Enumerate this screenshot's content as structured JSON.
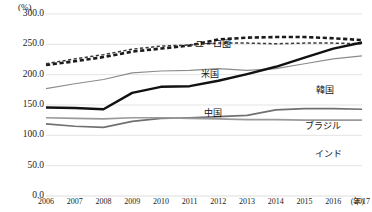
{
  "chart_data": {
    "type": "line",
    "title": "",
    "xlabel": "(年)",
    "ylabel": "(%)",
    "unit_label": "(%)",
    "x_unit_label": "(年)",
    "categories": [
      "2006",
      "2007",
      "2008",
      "2009",
      "2010",
      "2011",
      "2012",
      "2013",
      "2014",
      "2015",
      "2016",
      "2017"
    ],
    "ylim": [
      0,
      300
    ],
    "yticks": [
      "0.0",
      "50.0",
      "100.0",
      "150.0",
      "200.0",
      "250.0",
      "300.0"
    ],
    "ytick_values": [
      0,
      50,
      100,
      150,
      200,
      250,
      300
    ],
    "grid": true,
    "legend": "inline-labels",
    "series": [
      {
        "name": "ユーロ圏",
        "label": "ユーロ圏",
        "color": "#1a1a1a",
        "style": "dashed-thick",
        "values": [
          216.0,
          222.0,
          229.0,
          238.0,
          243.0,
          248.0,
          258.0,
          261.0,
          262.0,
          262.0,
          260.0,
          257.0
        ]
      },
      {
        "name": "米国",
        "label": "米国",
        "color": "#3a3a3a",
        "style": "dashed-thin",
        "values": [
          218.0,
          226.0,
          233.0,
          242.0,
          247.0,
          249.0,
          252.0,
          252.0,
          251.0,
          252.0,
          252.0,
          251.0
        ]
      },
      {
        "name": "韓国",
        "label": "韓国",
        "color": "#8c8c8c",
        "style": "solid-thin",
        "values": [
          177.0,
          185.0,
          192.0,
          203.0,
          206.0,
          207.0,
          210.0,
          207.0,
          210.0,
          218.0,
          226.0,
          231.0
        ]
      },
      {
        "name": "中国",
        "label": "中国",
        "color": "#111111",
        "style": "solid-thick",
        "values": [
          146.0,
          145.0,
          143.0,
          170.0,
          180.0,
          181.0,
          190.0,
          201.0,
          213.0,
          228.0,
          243.0,
          253.0
        ]
      },
      {
        "name": "ブラジル",
        "label": "ブラジル",
        "color": "#707070",
        "style": "solid-medium",
        "values": [
          119.0,
          115.0,
          113.0,
          123.0,
          128.0,
          129.0,
          131.0,
          133.0,
          142.0,
          144.0,
          144.0,
          143.0
        ]
      },
      {
        "name": "インド",
        "label": "インド",
        "color": "#9a9a9a",
        "style": "solid-medium",
        "values": [
          129.0,
          128.0,
          127.0,
          129.0,
          129.0,
          128.0,
          127.0,
          126.0,
          126.0,
          125.0,
          125.0,
          125.0
        ]
      }
    ],
    "annotations": [
      {
        "name": "eurozone",
        "text": "ユーロ圏",
        "x_pct": 47.0,
        "y_px": 26.0
      },
      {
        "name": "usa",
        "text": "米国",
        "x_pct": 49.0,
        "y_px": 56.0
      },
      {
        "name": "korea",
        "text": "韓国",
        "x_pct": 85.5,
        "y_px": 72.0
      },
      {
        "name": "china",
        "text": "中国",
        "x_pct": 50.0,
        "y_px": 95.0
      },
      {
        "name": "brazil",
        "text": "ブラジル",
        "x_pct": 82.0,
        "y_px": 108.0
      },
      {
        "name": "india",
        "text": "インド",
        "x_pct": 85.0,
        "y_px": 136.0
      }
    ]
  }
}
